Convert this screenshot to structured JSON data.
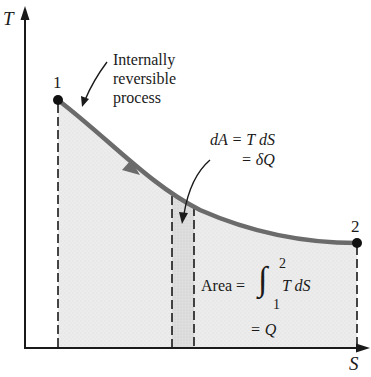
{
  "diagram": {
    "type": "T-S diagram",
    "axes": {
      "y_label": "T",
      "x_label": "S"
    },
    "points": [
      {
        "label": "1",
        "x": 58,
        "y": 100
      },
      {
        "label": "2",
        "x": 357,
        "y": 243
      }
    ],
    "process_annotation": {
      "line1": "Internally",
      "line2": "reversible",
      "line3": "process"
    },
    "strip_annotation": {
      "line1": "dA = T dS",
      "line2": "= δQ"
    },
    "area_annotation": {
      "prefix": "Area =",
      "integral": "∫",
      "upper_limit": "2",
      "lower_limit": "1",
      "integrand": "T dS",
      "result": "= Q"
    },
    "colors": {
      "curve": "#6b6b6b",
      "axes": "#1a1a1a",
      "area_fill": "#e9e9e9",
      "strip_fill": "#dcdcdc",
      "points": "#111111"
    }
  }
}
